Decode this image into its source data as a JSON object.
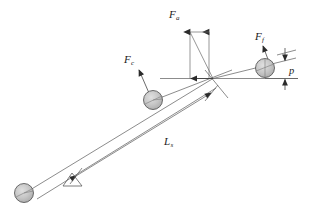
{
  "figure": {
    "type": "engineering-force-diagram",
    "title": "",
    "background_color": "#ffffff",
    "line_color": "#3c3c3c",
    "sphere_fill": "#c9c9c9",
    "sphere_stroke": "#4a4a4a",
    "text_color": "#1a1a1a"
  },
  "labels": {
    "force_vertical": {
      "symbol": "F",
      "subscript": "a"
    },
    "force_left": {
      "symbol": "F",
      "subscript": "c"
    },
    "force_right": {
      "symbol": "F",
      "subscript": "f"
    },
    "length": {
      "symbol": "L",
      "subscript": "s"
    },
    "gap": {
      "symbol": "p",
      "subscript": ""
    }
  },
  "elements": {
    "sphere_lower_left": "sphere",
    "sphere_middle": "sphere",
    "sphere_upper_right": "sphere",
    "pivot_support": "triangle-fulcrum",
    "beam": "inclined-beam",
    "dimension_line": "length-dimension",
    "gap_dimension": "vertical-gap-dimension"
  }
}
